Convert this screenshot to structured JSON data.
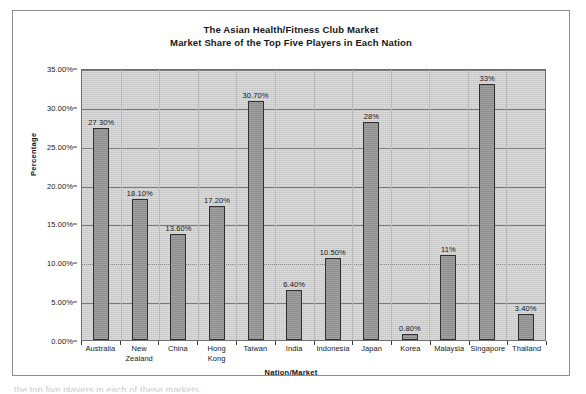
{
  "chart_data": {
    "type": "bar",
    "title": "The Asian Health/Fitness Club Market",
    "subtitle": "Market Share of the Top Five Players in Each Nation",
    "xlabel": "Nation/Market",
    "ylabel": "Percentage",
    "ylim": [
      0,
      35
    ],
    "ytick_step": 5,
    "grid": true,
    "legend": "none",
    "categories": [
      "Australia",
      "New Zealand",
      "China",
      "Hong Kong",
      "Taiwan",
      "India",
      "Indonesia",
      "Japan",
      "Korea",
      "Malaysia",
      "Singapore",
      "Thailand"
    ],
    "values": [
      27.3,
      18.1,
      13.6,
      17.2,
      30.7,
      6.4,
      10.5,
      28.0,
      0.8,
      11.0,
      33.0,
      3.4
    ],
    "data_labels": [
      "27 30%",
      "18.10%",
      "13.60%",
      "17.20%",
      "30.70%",
      "6.40%",
      "10.50%",
      "28%",
      "0.80%",
      "11%",
      "33%",
      "3.40%"
    ],
    "ytick_labels": [
      "35.00%",
      "30.00%",
      "25.00%",
      "20.00%",
      "15.00%",
      "10.00%",
      "5.00%",
      "0.00%"
    ],
    "ytick_values": [
      35,
      30,
      25,
      20,
      15,
      10,
      5,
      0
    ],
    "category_lines": [
      [
        "Australia"
      ],
      [
        "New",
        "Zealand"
      ],
      [
        "China"
      ],
      [
        "Hong",
        "Kong"
      ],
      [
        "Taiwan"
      ],
      [
        "India"
      ],
      [
        "Indonesia"
      ],
      [
        "Japan"
      ],
      [
        "Korea"
      ],
      [
        "Malaysia"
      ],
      [
        "Singapore"
      ],
      [
        "Thailand"
      ]
    ]
  },
  "colors": {
    "plot_background": "#d2d2d2",
    "bar_fill": "#969696",
    "bar_border": "#2f2f2f",
    "gridline": "#7b7b7b",
    "text": "#171717",
    "frame": "#8d8d8d"
  },
  "caption_fragment": "the top five players in each of these markets"
}
